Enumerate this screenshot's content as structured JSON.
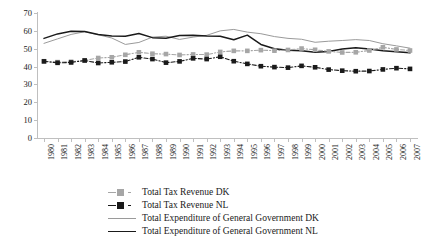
{
  "chart_data": {
    "type": "line",
    "title": "",
    "subtitle": "",
    "xlabel": "",
    "ylabel": "",
    "ylim": [
      0,
      70
    ],
    "yticks": [
      0,
      10,
      20,
      30,
      40,
      50,
      60,
      70
    ],
    "grid": false,
    "legend_position": "bottom",
    "x": [
      1980,
      1981,
      1982,
      1983,
      1984,
      1985,
      1986,
      1987,
      1988,
      1989,
      1990,
      1991,
      1992,
      1993,
      1994,
      1995,
      1996,
      1997,
      1998,
      1999,
      2000,
      2001,
      2002,
      2003,
      2004,
      2005,
      2006,
      2007
    ],
    "categories": [
      "1980",
      "1981",
      "1982",
      "1983",
      "1984",
      "1985",
      "1986",
      "1987",
      "1988",
      "1989",
      "1990",
      "1991",
      "1992",
      "1993",
      "1994",
      "1995",
      "1996",
      "1997",
      "1998",
      "1999",
      "2000",
      "2001",
      "2002",
      "2003",
      "2004",
      "2005",
      "2006",
      "2007"
    ],
    "series": [
      {
        "name": "Total Tax Revenue DK",
        "color": "#a6a6a6",
        "style": "dashed-marker",
        "marker": "square",
        "values": [
          43.0,
          42.5,
          42.7,
          43.5,
          44.8,
          45.2,
          46.6,
          48.0,
          47.2,
          47.0,
          46.5,
          46.8,
          46.7,
          48.2,
          48.8,
          48.8,
          49.2,
          48.9,
          49.3,
          50.1,
          49.4,
          48.5,
          47.9,
          48.0,
          49.0,
          50.8,
          49.6,
          49.0
        ]
      },
      {
        "name": "Total Tax Revenue NL",
        "color": "#1a1a1a",
        "style": "dashed-marker",
        "marker": "square",
        "values": [
          42.9,
          42.1,
          42.3,
          43.4,
          42.0,
          42.4,
          42.8,
          45.2,
          44.2,
          42.2,
          42.9,
          44.6,
          44.2,
          45.5,
          43.0,
          41.5,
          40.2,
          39.7,
          39.4,
          40.4,
          39.6,
          38.3,
          37.7,
          37.4,
          37.5,
          38.4,
          39.1,
          38.7
        ]
      },
      {
        "name": "Total Expenditure of General Government DK",
        "color": "#9a9a9a",
        "style": "solid",
        "marker": "none",
        "values": [
          53.0,
          55.5,
          58.0,
          59.5,
          57.8,
          56.0,
          52.4,
          53.5,
          56.5,
          57.0,
          55.2,
          56.5,
          57.5,
          60.0,
          60.8,
          59.3,
          58.4,
          56.8,
          55.8,
          55.3,
          53.6,
          54.2,
          54.6,
          55.1,
          54.6,
          52.8,
          51.6,
          50.3
        ]
      },
      {
        "name": "Total Expenditure of General Government NL",
        "color": "#1a1a1a",
        "style": "solid",
        "marker": "none",
        "values": [
          55.8,
          58.3,
          59.8,
          59.6,
          58.0,
          57.1,
          57.0,
          58.5,
          56.2,
          55.9,
          57.4,
          57.5,
          57.1,
          57.0,
          55.0,
          57.6,
          52.4,
          50.0,
          49.2,
          48.8,
          48.0,
          48.4,
          49.8,
          50.6,
          49.8,
          48.8,
          48.3,
          47.7
        ]
      }
    ]
  },
  "axes": {
    "y_tick_labels": [
      "0",
      "10",
      "20",
      "30",
      "40",
      "50",
      "60",
      "70"
    ],
    "x_tick_labels": [
      "1980",
      "1981",
      "1982",
      "1983",
      "1984",
      "1985",
      "1986",
      "1987",
      "1988",
      "1989",
      "1990",
      "1991",
      "1992",
      "1993",
      "1994",
      "1995",
      "1996",
      "1997",
      "1998",
      "1999",
      "2000",
      "2001",
      "2002",
      "2003",
      "2004",
      "2005",
      "2006",
      "2007"
    ]
  },
  "legend": {
    "items": [
      {
        "label": "Total Tax Revenue DK"
      },
      {
        "label": "Total Tax Revenue NL"
      },
      {
        "label": "Total Expenditure of General Government DK"
      },
      {
        "label": "Total Expenditure of General Government NL"
      }
    ]
  },
  "colors": {
    "series_dk_tax": "#a6a6a6",
    "series_nl_tax": "#1a1a1a",
    "series_dk_exp": "#9a9a9a",
    "series_nl_exp": "#1a1a1a",
    "axis": "#bfbfbf",
    "background": "#ffffff"
  }
}
